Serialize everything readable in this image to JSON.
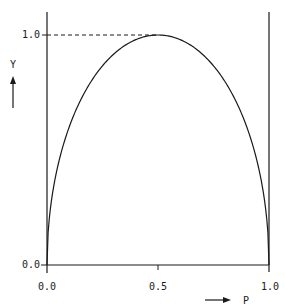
{
  "chart_data": {
    "type": "line",
    "title": "",
    "xlabel": "P",
    "ylabel": "Y",
    "xlim": [
      0.0,
      1.0
    ],
    "ylim": [
      0.0,
      1.0
    ],
    "x_ticks": [
      "0.0",
      "0.5",
      "1.0"
    ],
    "y_ticks": [
      "0.0",
      "1.0"
    ],
    "grid": false,
    "legend": null,
    "annotations": [
      "dashed reference line at Y = 1.0 from Y-axis to curve peak at P = 0.5"
    ],
    "series": [
      {
        "name": "Y vs P",
        "x": [
          0.0,
          0.05,
          0.1,
          0.2,
          0.3,
          0.4,
          0.5,
          0.6,
          0.7,
          0.8,
          0.9,
          0.95,
          1.0
        ],
        "values": [
          0.0,
          0.29,
          0.47,
          0.72,
          0.88,
          0.97,
          1.0,
          0.97,
          0.88,
          0.72,
          0.47,
          0.29,
          0.0
        ]
      }
    ]
  },
  "axes": {
    "x_label": "P",
    "y_label": "Y",
    "x_tick_labels": [
      "0.0",
      "0.5",
      "1.0"
    ],
    "y_tick_labels": [
      "0.0",
      "1.0"
    ]
  },
  "colors": {
    "line": "#1a1a1a",
    "background": "#ffffff"
  }
}
